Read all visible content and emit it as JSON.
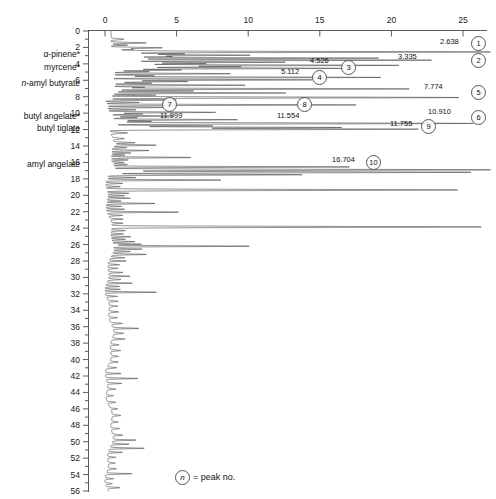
{
  "chart_data": {
    "type": "line",
    "title": "",
    "subtitle": "",
    "orientation": "horizontal-signal-vertical-time",
    "xlabel": "mVolts",
    "ylabel": "",
    "xlim": [
      0,
      27.5
    ],
    "ylim": [
      0,
      56
    ],
    "grid": false,
    "legend_position": "bottom-center",
    "x_ticks": [
      0,
      5,
      10,
      15,
      20,
      25
    ],
    "x_tick_labels": [
      "0",
      "5",
      "10",
      "15",
      "20",
      "25"
    ],
    "y_ticks": [
      0,
      2,
      4,
      6,
      8,
      10,
      12,
      14,
      16,
      18,
      20,
      22,
      24,
      26,
      28,
      30,
      32,
      34,
      36,
      38,
      40,
      42,
      44,
      46,
      48,
      50,
      52,
      54,
      56
    ],
    "y_tick_labels": [
      "0",
      "2",
      "4",
      "6",
      "8",
      "10",
      "12",
      "14",
      "16",
      "18",
      "20",
      "22",
      "24",
      "26",
      "28",
      "30",
      "32",
      "34",
      "36",
      "38",
      "40",
      "42",
      "44",
      "46",
      "48",
      "50",
      "52",
      "54",
      "56"
    ],
    "y_minor_ticks": [
      1,
      3,
      5,
      7,
      9,
      11,
      13,
      15,
      17,
      19,
      21,
      23,
      25,
      27,
      29,
      31,
      33,
      35,
      37,
      39,
      41,
      43,
      45,
      47,
      49,
      51,
      53,
      55
    ],
    "compound_labels": [
      {
        "name": "α-pinene*",
        "time": 2.85,
        "italic_prefix": ""
      },
      {
        "name": "myrcene*",
        "time": 4.35,
        "italic_prefix": ""
      },
      {
        "name": "-amyl butyrate",
        "time": 6.3,
        "italic_prefix": "n"
      },
      {
        "name": "butyl angelate*",
        "time": 10.35,
        "italic_prefix": ""
      },
      {
        "name": "butyl tiglate",
        "time": 11.85,
        "italic_prefix": ""
      },
      {
        "name": "amyl angelate",
        "time": 16.2,
        "italic_prefix": ""
      }
    ],
    "numbered_peaks": [
      {
        "no": "1",
        "value": "2.638",
        "mvolts": 26.38,
        "time": 2.55,
        "label_x": 440,
        "label_y": 38,
        "circle_x": 471,
        "circle_y": 36
      },
      {
        "no": "2",
        "value": "3.335",
        "mvolts": 22.0,
        "time": 3.55,
        "label_x": 398,
        "label_y": 53,
        "circle_x": 471,
        "circle_y": 53
      },
      {
        "no": "3",
        "value": "4.526",
        "mvolts": 16.2,
        "time": 4.55,
        "label_x": 310,
        "label_y": 57,
        "circle_x": 341,
        "circle_y": 60
      },
      {
        "no": "4",
        "value": "5.112",
        "mvolts": 14.1,
        "time": 5.95,
        "label_x": 281,
        "label_y": 68,
        "circle_x": 312,
        "circle_y": 70
      },
      {
        "no": "5",
        "value": "7.774",
        "mvolts": 24.6,
        "time": 8.1,
        "label_x": 424,
        "label_y": 83,
        "circle_x": 471,
        "circle_y": 85
      },
      {
        "no": "6",
        "value": "10.910",
        "mvolts": 25.4,
        "time": 11.25,
        "label_x": 428,
        "label_y": 108,
        "circle_x": 471,
        "circle_y": 110
      },
      {
        "no": "7",
        "value": "11.999",
        "mvolts": 7.3,
        "time": 11.55,
        "label_x": 160,
        "label_y": 112,
        "circle_x": 162,
        "circle_y": 97
      },
      {
        "no": "8",
        "value": "11.554",
        "mvolts": 16.0,
        "time": 11.6,
        "label_x": 277,
        "label_y": 112,
        "circle_x": 297,
        "circle_y": 97
      },
      {
        "no": "9",
        "value": "11.755",
        "mvolts": 21.5,
        "time": 11.95,
        "label_x": 390,
        "label_y": 120,
        "circle_x": 421,
        "circle_y": 119
      },
      {
        "no": "10",
        "value": "16.704",
        "mvolts": 16.5,
        "time": 16.55,
        "label_x": 332,
        "label_y": 156,
        "circle_x": 366,
        "circle_y": 155
      }
    ],
    "legend_symbol": "n",
    "legend_text": "= peak no."
  }
}
